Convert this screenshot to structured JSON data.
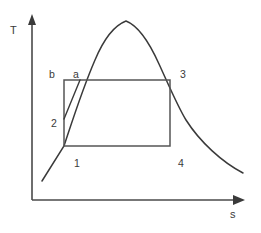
{
  "diagram": {
    "axes": {
      "y_label": "T",
      "x_label": "s",
      "y_axis": {
        "x": 32,
        "top": 18,
        "bottom": 200
      },
      "x_axis": {
        "y": 200,
        "left": 32,
        "right": 243
      }
    },
    "colors": {
      "curve": "#3a3a3a",
      "rect": "#555555",
      "axis": "#4a4a4a",
      "text": "#3a3a3a",
      "background": "#ffffff"
    },
    "labels": [
      {
        "id": "label-b",
        "text": "b",
        "x": 49,
        "y": 78
      },
      {
        "id": "label-a",
        "text": "a",
        "x": 73,
        "y": 78
      },
      {
        "id": "label-3",
        "text": "3",
        "x": 180,
        "y": 78
      },
      {
        "id": "label-2",
        "text": "2",
        "x": 51,
        "y": 127
      },
      {
        "id": "label-1",
        "text": "1",
        "x": 74,
        "y": 167
      },
      {
        "id": "label-4",
        "text": "4",
        "x": 178,
        "y": 167
      }
    ],
    "points": {
      "1": {
        "x": 64,
        "y": 146
      },
      "2": {
        "x": 64,
        "y": 119
      },
      "3": {
        "x": 170,
        "y": 80
      },
      "4": {
        "x": 170,
        "y": 146
      },
      "a": {
        "x": 80,
        "y": 80
      },
      "b": {
        "x": 64,
        "y": 80
      }
    },
    "cycle_rectangle": {
      "x": 64,
      "y": 80,
      "width": 106,
      "height": 66
    },
    "saturation_dome": {
      "apex": {
        "x": 126,
        "y": 21
      },
      "left_tail_end": {
        "x": 42,
        "y": 181
      },
      "right_tail_end": {
        "x": 243,
        "y": 173
      },
      "path": "M 42 181 L 64 146 C 72 122 82 90 95 60 C 103 41 113 26 126 21 C 139 26 150 44 159 64 C 170 88 178 107 186 120 C 200 142 222 162 243 173"
    },
    "process_lines": [
      {
        "id": "line-2-a",
        "from": "2",
        "to": "a",
        "path": "M 64 119 L 80 80"
      }
    ]
  }
}
